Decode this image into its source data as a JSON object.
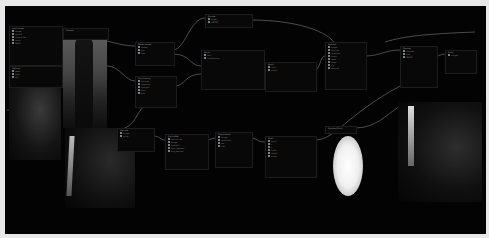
{
  "app": {
    "name": "Node graph editor"
  },
  "canvas": {
    "background": "#030303",
    "border": "#e8e8e8"
  },
  "nodes": [
    {
      "id": "n1",
      "title": "Load Image",
      "x": 4,
      "y": 20,
      "w": 52,
      "h": 38,
      "rows": [
        "image",
        "upload",
        "choose file",
        "mask",
        "MASK"
      ]
    },
    {
      "id": "n2",
      "title": "Preview",
      "x": 58,
      "y": 22,
      "w": 44,
      "h": 10,
      "rows": []
    },
    {
      "id": "n3",
      "title": "Settings",
      "x": 4,
      "y": 60,
      "w": 52,
      "h": 20,
      "rows": [
        "seed",
        "steps",
        "cfg"
      ]
    },
    {
      "id": "n4",
      "title": "Model Loader",
      "x": 130,
      "y": 36,
      "w": 38,
      "h": 22,
      "rows": [
        "model",
        "clip",
        "vae"
      ]
    },
    {
      "id": "n5",
      "title": "Group",
      "x": 196,
      "y": 44,
      "w": 62,
      "h": 38,
      "rows": [
        "text",
        "conditioning"
      ]
    },
    {
      "id": "n6",
      "title": "Encode",
      "x": 200,
      "y": 8,
      "w": 46,
      "h": 12,
      "rows": [
        "pixels",
        "LATENT"
      ]
    },
    {
      "id": "n7",
      "title": "Conditioning",
      "x": 130,
      "y": 70,
      "w": 40,
      "h": 30,
      "rows": [
        "positive",
        "negative",
        "strength",
        "start",
        "end"
      ]
    },
    {
      "id": "n8",
      "title": "Sampler",
      "x": 320,
      "y": 36,
      "w": 40,
      "h": 46,
      "rows": [
        "model",
        "positive",
        "negative",
        "latent",
        "seed",
        "steps",
        "cfg",
        "denoise"
      ]
    },
    {
      "id": "n9",
      "title": "Apply",
      "x": 260,
      "y": 56,
      "w": 50,
      "h": 28,
      "rows": [
        "input",
        "output"
      ]
    },
    {
      "id": "n10",
      "title": "Decode",
      "x": 395,
      "y": 40,
      "w": 36,
      "h": 40,
      "rows": [
        "samples",
        "vae",
        "IMAGE"
      ]
    },
    {
      "id": "n11",
      "title": "Save",
      "x": 440,
      "y": 44,
      "w": 30,
      "h": 22,
      "rows": [
        "images"
      ]
    },
    {
      "id": "n12",
      "title": "ControlNet",
      "x": 160,
      "y": 128,
      "w": 42,
      "h": 34,
      "rows": [
        "control_net",
        "image",
        "strength",
        "start_percent",
        "end_percent"
      ]
    },
    {
      "id": "n13",
      "title": "Preprocessor",
      "x": 210,
      "y": 126,
      "w": 36,
      "h": 34,
      "rows": [
        "image",
        "resolution",
        "low",
        "high"
      ]
    },
    {
      "id": "n14",
      "title": "Mask",
      "x": 260,
      "y": 130,
      "w": 50,
      "h": 40,
      "rows": [
        "mask",
        "x",
        "y",
        "width",
        "height",
        "value"
      ]
    },
    {
      "id": "n15",
      "title": "Upscale",
      "x": 112,
      "y": 122,
      "w": 36,
      "h": 22,
      "rows": [
        "image",
        "scale"
      ]
    },
    {
      "id": "n16",
      "title": "Gradient Mask",
      "x": 320,
      "y": 120,
      "w": 30,
      "h": 6,
      "rows": []
    }
  ],
  "images": [
    {
      "id": "preview-left-top",
      "x": 58,
      "y": 32,
      "w": 44,
      "h": 90,
      "tone": "gray"
    },
    {
      "id": "preview-left-side",
      "x": 4,
      "y": 82,
      "w": 52,
      "h": 72,
      "tone": "dark"
    },
    {
      "id": "preview-left-bottom",
      "x": 60,
      "y": 122,
      "w": 70,
      "h": 80,
      "tone": "dark"
    },
    {
      "id": "preview-right",
      "x": 393,
      "y": 96,
      "w": 84,
      "h": 100,
      "tone": "dark"
    }
  ],
  "mask_preview": {
    "x": 328,
    "y": 130,
    "w": 30,
    "h": 60
  }
}
